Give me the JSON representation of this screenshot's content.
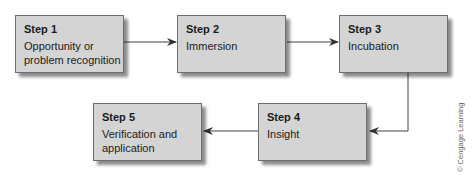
{
  "diagram": {
    "steps": [
      {
        "title": "Step 1",
        "description": "Opportunity or problem recognition",
        "lines": [
          "Opportunity or",
          "problem recognition"
        ]
      },
      {
        "title": "Step 2",
        "description": "Immersion",
        "lines": [
          "Immersion"
        ]
      },
      {
        "title": "Step 3",
        "description": "Incubation",
        "lines": [
          "Incubation"
        ]
      },
      {
        "title": "Step 4",
        "description": "Insight",
        "lines": [
          "Insight"
        ]
      },
      {
        "title": "Step 5",
        "description": "Verification and application",
        "lines": [
          "Verification and",
          "application"
        ]
      }
    ],
    "connections": [
      {
        "from": "Step 1",
        "to": "Step 2"
      },
      {
        "from": "Step 2",
        "to": "Step 3"
      },
      {
        "from": "Step 3",
        "to": "Step 4"
      },
      {
        "from": "Step 4",
        "to": "Step 5"
      }
    ],
    "credit": "© Cengage Learning"
  },
  "colors": {
    "box_fill": "#d4d4d4",
    "box_border": "#6e6e6e",
    "arrow": "#333333"
  }
}
